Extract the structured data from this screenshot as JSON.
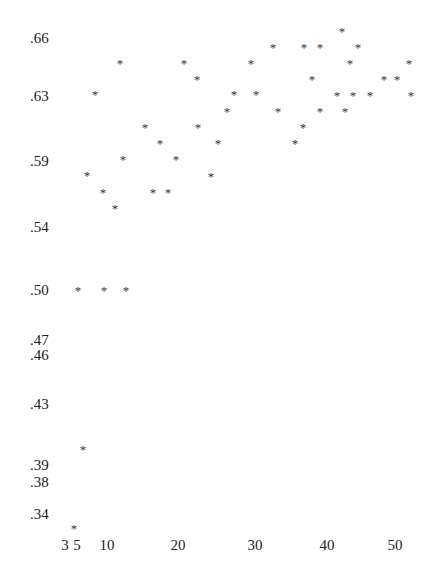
{
  "chart_data": {
    "type": "scatter",
    "title": "",
    "xlabel": "",
    "ylabel": "",
    "marker": "*",
    "grid": false,
    "legend": null,
    "xlim": [
      2,
      53
    ],
    "ylim": [
      0.33,
      0.67
    ],
    "x_ticks": [
      "3",
      "5",
      "10",
      "20",
      "30",
      "40",
      "50"
    ],
    "y_ticks": [
      ".66",
      ".63",
      ".59",
      ".54",
      ".50",
      ".47",
      ".46",
      ".43",
      ".39",
      ".38",
      ".34"
    ],
    "points": [
      {
        "x": 4.5,
        "y": 0.33
      },
      {
        "x": 5.5,
        "y": 0.38
      },
      {
        "x": 5,
        "y": 0.5
      },
      {
        "x": 9,
        "y": 0.5
      },
      {
        "x": 12,
        "y": 0.5
      },
      {
        "x": 6,
        "y": 0.58
      },
      {
        "x": 8,
        "y": 0.57
      },
      {
        "x": 11,
        "y": 0.56
      },
      {
        "x": 12,
        "y": 0.59
      },
      {
        "x": 7,
        "y": 0.63
      },
      {
        "x": 12,
        "y": 0.65
      },
      {
        "x": 15,
        "y": 0.61
      },
      {
        "x": 17,
        "y": 0.6
      },
      {
        "x": 16,
        "y": 0.57
      },
      {
        "x": 18,
        "y": 0.57
      },
      {
        "x": 19,
        "y": 0.59
      },
      {
        "x": 21,
        "y": 0.65
      },
      {
        "x": 23,
        "y": 0.64
      },
      {
        "x": 23,
        "y": 0.61
      },
      {
        "x": 24,
        "y": 0.58
      },
      {
        "x": 25,
        "y": 0.6
      },
      {
        "x": 26,
        "y": 0.62
      },
      {
        "x": 27,
        "y": 0.63
      },
      {
        "x": 30,
        "y": 0.65
      },
      {
        "x": 30,
        "y": 0.63
      },
      {
        "x": 33,
        "y": 0.66
      },
      {
        "x": 33,
        "y": 0.62
      },
      {
        "x": 36,
        "y": 0.6
      },
      {
        "x": 37,
        "y": 0.61
      },
      {
        "x": 37,
        "y": 0.66
      },
      {
        "x": 38,
        "y": 0.64
      },
      {
        "x": 39,
        "y": 0.66
      },
      {
        "x": 39,
        "y": 0.62
      },
      {
        "x": 42,
        "y": 0.63
      },
      {
        "x": 42,
        "y": 0.67
      },
      {
        "x": 43,
        "y": 0.62
      },
      {
        "x": 43,
        "y": 0.65
      },
      {
        "x": 44,
        "y": 0.63
      },
      {
        "x": 45,
        "y": 0.66
      },
      {
        "x": 46,
        "y": 0.63
      },
      {
        "x": 49,
        "y": 0.64
      },
      {
        "x": 50,
        "y": 0.64
      },
      {
        "x": 52,
        "y": 0.65
      },
      {
        "x": 52,
        "y": 0.63
      }
    ]
  },
  "axes": {
    "y_labels": [
      {
        "text": ".66",
        "top": 38
      },
      {
        "text": ".63",
        "top": 96
      },
      {
        "text": ".59",
        "top": 161
      },
      {
        "text": ".54",
        "top": 227
      },
      {
        "text": ".50",
        "top": 290
      },
      {
        "text": ".47",
        "top": 340
      },
      {
        "text": ".46",
        "top": 355
      },
      {
        "text": ".43",
        "top": 404
      },
      {
        "text": ".39",
        "top": 465
      },
      {
        "text": ".38",
        "top": 482
      },
      {
        "text": ".34",
        "top": 514
      }
    ],
    "x_labels": [
      {
        "text": "3",
        "left": 65
      },
      {
        "text": "5",
        "left": 77
      },
      {
        "text": "10",
        "left": 107
      },
      {
        "text": "20",
        "left": 178
      },
      {
        "text": "30",
        "left": 255
      },
      {
        "text": "40",
        "left": 327
      },
      {
        "text": "50",
        "left": 395
      }
    ]
  },
  "marker_positions": [
    [
      74,
      527
    ],
    [
      83,
      448
    ],
    [
      78,
      289
    ],
    [
      104,
      289
    ],
    [
      126,
      289
    ],
    [
      87,
      174
    ],
    [
      103,
      191
    ],
    [
      115,
      207
    ],
    [
      123,
      158
    ],
    [
      95,
      93
    ],
    [
      120,
      62
    ],
    [
      145,
      126
    ],
    [
      160,
      142
    ],
    [
      153,
      191
    ],
    [
      168,
      191
    ],
    [
      176,
      158
    ],
    [
      184,
      62
    ],
    [
      197,
      78
    ],
    [
      198,
      126
    ],
    [
      211,
      175
    ],
    [
      218,
      142
    ],
    [
      227,
      110
    ],
    [
      234,
      93
    ],
    [
      251,
      62
    ],
    [
      256,
      93
    ],
    [
      273,
      46
    ],
    [
      278,
      110
    ],
    [
      295,
      142
    ],
    [
      303,
      126
    ],
    [
      304,
      46
    ],
    [
      312,
      78
    ],
    [
      320,
      110
    ],
    [
      320,
      46
    ],
    [
      337,
      94
    ],
    [
      342,
      30
    ],
    [
      345,
      110
    ],
    [
      350,
      62
    ],
    [
      353,
      94
    ],
    [
      358,
      46
    ],
    [
      370,
      94
    ],
    [
      384,
      78
    ],
    [
      397,
      78
    ],
    [
      409,
      62
    ],
    [
      411,
      94
    ]
  ]
}
